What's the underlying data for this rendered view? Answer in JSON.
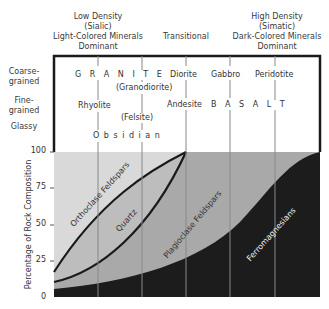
{
  "header": {
    "left": {
      "line1": "Low Density",
      "line2": "(Sialic)",
      "line3": "Light-Colored Minerals",
      "line4": "Dominant"
    },
    "middle": {
      "line1": "Transitional"
    },
    "right": {
      "line1": "High Density",
      "line2": "(Simatic)",
      "line3": "Dark-Colored Minerals",
      "line4": "Dominant"
    }
  },
  "rows": {
    "coarse": {
      "line1": "Coarse-",
      "line2": "grained"
    },
    "fine": {
      "line1": "Fine-",
      "line2": "grained"
    },
    "glassy": "Glassy"
  },
  "rocks": {
    "granite": "G R A N I T E",
    "granodiorite": "(Granodiorite)",
    "diorite": "Diorite",
    "gabbro": "Gabbro",
    "peridotite": "Peridotite",
    "rhyolite": "Rhyolite",
    "felsite": "(Felsite)",
    "andesite": "Andesite",
    "basalt": "B A S A L T",
    "obsidian": "O b s i d i a n"
  },
  "axis": {
    "ylabel": "Percentage of Rock Composition",
    "ticks": [
      "100",
      "75",
      "50",
      "25",
      "0"
    ]
  },
  "minerals": {
    "orthoclase": "Orthoclase Feldspars",
    "quartz": "Quartz",
    "plagioclase": "Plagioclase Feldspars",
    "ferromagnesians": "Ferromagnesians"
  },
  "colors": {
    "orthoclase": "#d9d9d9",
    "quartz": "#bdbdbd",
    "plagioclase": "#a9a9a9",
    "ferromagnesians": "#1c1c1c",
    "lines": "#1a1a1a"
  }
}
